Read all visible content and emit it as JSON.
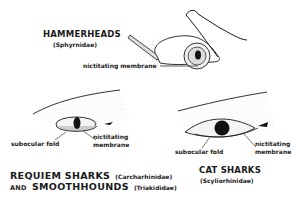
{
  "diagrams": {
    "hammerheads": {
      "title": "HAMMERHEADS",
      "family": "(Sphyrnidae)",
      "labels": {
        "nictitating": "nictitating membrane"
      }
    },
    "requiem": {
      "title_line1_a": "REQUIEM SHARKS",
      "title_line1_b": "(Carcharhinidae)",
      "title_line2_and": "AND",
      "title_line2_a": "SMOOTHHOUNDS",
      "title_line2_b": "(Triakididae)",
      "labels": {
        "subocular": "subocular fold",
        "nictitating_1": "nictitating",
        "nictitating_2": "membrane"
      }
    },
    "catsharks": {
      "title": "CAT SHARKS",
      "family": "(Scyliorhinidae)",
      "labels": {
        "subocular": "subocular fold",
        "nictitating_1": "nictitating",
        "nictitating_2": "membrane"
      }
    }
  },
  "colors": {
    "ink": "#1a1a1a",
    "background": "#ffffff",
    "stipple": "#9a9a9a"
  }
}
